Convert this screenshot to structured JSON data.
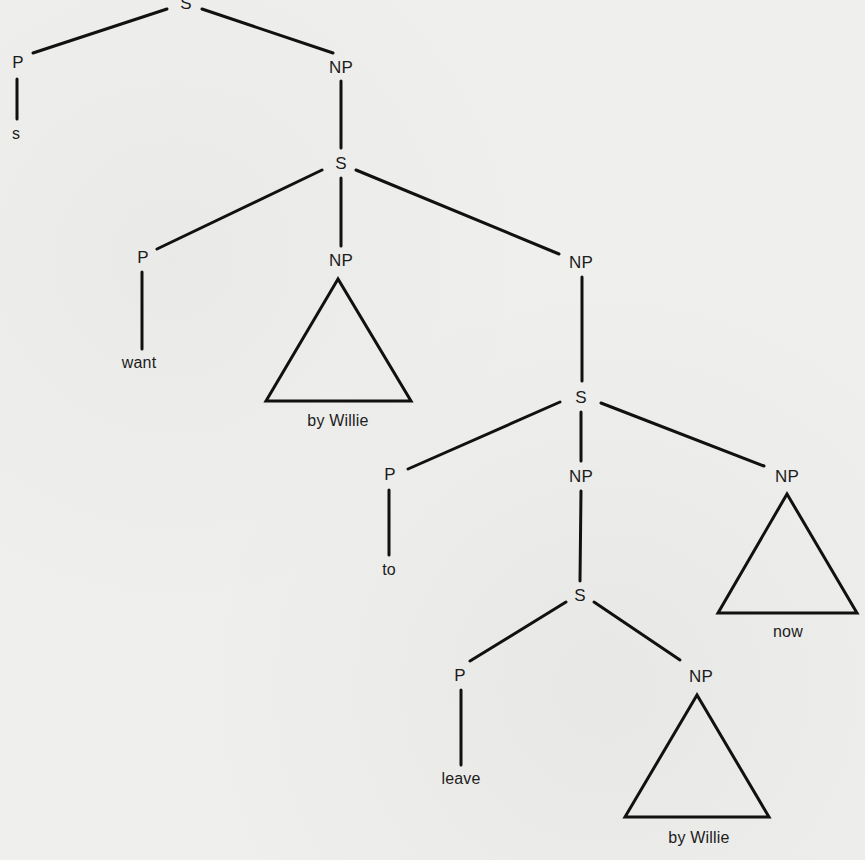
{
  "diagram": {
    "type": "syntax-tree",
    "stroke_color": "#111111",
    "background": "#efefed",
    "nodes": [
      {
        "id": "s_root",
        "label": "S",
        "x": 186,
        "y": 3
      },
      {
        "id": "p_1",
        "label": "P",
        "x": 18,
        "y": 62
      },
      {
        "id": "leaf_s",
        "label": "s",
        "x": 16,
        "y": 134
      },
      {
        "id": "np_1",
        "label": "NP",
        "x": 341,
        "y": 67
      },
      {
        "id": "s_2",
        "label": "S",
        "x": 341,
        "y": 163
      },
      {
        "id": "p_2",
        "label": "P",
        "x": 143,
        "y": 257
      },
      {
        "id": "leaf_want",
        "label": "want",
        "x": 139,
        "y": 363
      },
      {
        "id": "np_2",
        "label": "NP",
        "x": 341,
        "y": 260
      },
      {
        "id": "leaf_by_willie_1",
        "label": "by Willie",
        "x": 338,
        "y": 421
      },
      {
        "id": "np_3",
        "label": "NP",
        "x": 581,
        "y": 262
      },
      {
        "id": "s_3",
        "label": "S",
        "x": 581,
        "y": 397
      },
      {
        "id": "p_3",
        "label": "P",
        "x": 390,
        "y": 474
      },
      {
        "id": "leaf_to",
        "label": "to",
        "x": 389,
        "y": 570
      },
      {
        "id": "np_4",
        "label": "NP",
        "x": 581,
        "y": 476
      },
      {
        "id": "np_5",
        "label": "NP",
        "x": 787,
        "y": 476
      },
      {
        "id": "leaf_now",
        "label": "now",
        "x": 788,
        "y": 632
      },
      {
        "id": "s_4",
        "label": "S",
        "x": 580,
        "y": 595
      },
      {
        "id": "p_4",
        "label": "P",
        "x": 460,
        "y": 675
      },
      {
        "id": "leaf_leave",
        "label": "leave",
        "x": 461,
        "y": 779
      },
      {
        "id": "np_6",
        "label": "NP",
        "x": 701,
        "y": 676
      },
      {
        "id": "leaf_by_willie_2",
        "label": "by Willie",
        "x": 699,
        "y": 838
      }
    ],
    "edges": [
      {
        "from": "s_root",
        "to": "p_1",
        "x1": 167,
        "y1": 9,
        "x2": 33,
        "y2": 53
      },
      {
        "from": "s_root",
        "to": "np_1",
        "x1": 202,
        "y1": 9,
        "x2": 333,
        "y2": 53
      },
      {
        "from": "p_1",
        "to": "leaf_s",
        "x1": 17,
        "y1": 79,
        "x2": 17,
        "y2": 119
      },
      {
        "from": "np_1",
        "to": "s_2",
        "x1": 341,
        "y1": 81,
        "x2": 341,
        "y2": 148
      },
      {
        "from": "s_2",
        "to": "p_2",
        "x1": 322,
        "y1": 170,
        "x2": 157,
        "y2": 249
      },
      {
        "from": "s_2",
        "to": "np_2",
        "x1": 341,
        "y1": 178,
        "x2": 341,
        "y2": 246
      },
      {
        "from": "s_2",
        "to": "np_3",
        "x1": 356,
        "y1": 170,
        "x2": 559,
        "y2": 254
      },
      {
        "from": "p_2",
        "to": "leaf_want",
        "x1": 142,
        "y1": 272,
        "x2": 142,
        "y2": 349
      },
      {
        "from": "np_3",
        "to": "s_3",
        "x1": 582,
        "y1": 277,
        "x2": 582,
        "y2": 381
      },
      {
        "from": "s_3",
        "to": "p_3",
        "x1": 560,
        "y1": 402,
        "x2": 408,
        "y2": 469
      },
      {
        "from": "s_3",
        "to": "np_4",
        "x1": 581,
        "y1": 412,
        "x2": 581,
        "y2": 461
      },
      {
        "from": "s_3",
        "to": "np_5",
        "x1": 601,
        "y1": 403,
        "x2": 764,
        "y2": 466
      },
      {
        "from": "p_3",
        "to": "leaf_to",
        "x1": 389,
        "y1": 490,
        "x2": 389,
        "y2": 555
      },
      {
        "from": "np_4",
        "to": "s_4",
        "x1": 581,
        "y1": 491,
        "x2": 580,
        "y2": 581
      },
      {
        "from": "s_4",
        "to": "p_4",
        "x1": 566,
        "y1": 602,
        "x2": 470,
        "y2": 661
      },
      {
        "from": "s_4",
        "to": "np_6",
        "x1": 594,
        "y1": 602,
        "x2": 680,
        "y2": 660
      },
      {
        "from": "p_4",
        "to": "leaf_leave",
        "x1": 461,
        "y1": 690,
        "x2": 461,
        "y2": 765
      }
    ],
    "triangles": [
      {
        "parent": "np_2",
        "covers": "by Willie",
        "points": "338,279 266,401 411,401"
      },
      {
        "parent": "np_5",
        "covers": "now",
        "points": "787,494 718,613 857,613"
      },
      {
        "parent": "np_6",
        "covers": "by Willie",
        "points": "697,695 625,817 769,817"
      }
    ]
  }
}
